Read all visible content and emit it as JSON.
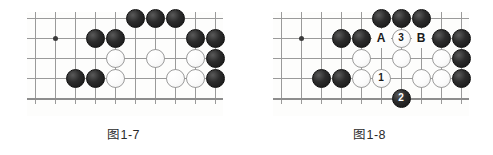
{
  "figures": [
    {
      "id": "fig-1-7",
      "caption": "图1-7",
      "board": {
        "cols": 10,
        "rows": 5,
        "spacing": 20,
        "hoshi": [
          {
            "col": 1,
            "row": 1
          }
        ],
        "bottom_edge": true
      },
      "stones": [
        {
          "col": 5,
          "row": 0,
          "color": "black"
        },
        {
          "col": 6,
          "row": 0,
          "color": "black"
        },
        {
          "col": 7,
          "row": 0,
          "color": "black"
        },
        {
          "col": 3,
          "row": 1,
          "color": "black"
        },
        {
          "col": 4,
          "row": 1,
          "color": "black"
        },
        {
          "col": 8,
          "row": 1,
          "color": "black"
        },
        {
          "col": 9,
          "row": 1,
          "color": "black"
        },
        {
          "col": 4,
          "row": 2,
          "color": "white"
        },
        {
          "col": 6,
          "row": 2,
          "color": "white"
        },
        {
          "col": 8,
          "row": 2,
          "color": "white"
        },
        {
          "col": 9,
          "row": 2,
          "color": "black"
        },
        {
          "col": 2,
          "row": 3,
          "color": "black"
        },
        {
          "col": 3,
          "row": 3,
          "color": "black"
        },
        {
          "col": 4,
          "row": 3,
          "color": "white"
        },
        {
          "col": 7,
          "row": 3,
          "color": "white"
        },
        {
          "col": 8,
          "row": 3,
          "color": "white"
        },
        {
          "col": 9,
          "row": 3,
          "color": "black"
        }
      ],
      "labels": []
    },
    {
      "id": "fig-1-8",
      "caption": "图1-8",
      "board": {
        "cols": 10,
        "rows": 5,
        "spacing": 20,
        "hoshi": [
          {
            "col": 1,
            "row": 1
          }
        ],
        "bottom_edge": true
      },
      "stones": [
        {
          "col": 5,
          "row": 0,
          "color": "black"
        },
        {
          "col": 6,
          "row": 0,
          "color": "black"
        },
        {
          "col": 7,
          "row": 0,
          "color": "black"
        },
        {
          "col": 3,
          "row": 1,
          "color": "black"
        },
        {
          "col": 4,
          "row": 1,
          "color": "black"
        },
        {
          "col": 6,
          "row": 1,
          "color": "white",
          "number": "3"
        },
        {
          "col": 8,
          "row": 1,
          "color": "black"
        },
        {
          "col": 9,
          "row": 1,
          "color": "black"
        },
        {
          "col": 4,
          "row": 2,
          "color": "white"
        },
        {
          "col": 6,
          "row": 2,
          "color": "white"
        },
        {
          "col": 8,
          "row": 2,
          "color": "white"
        },
        {
          "col": 9,
          "row": 2,
          "color": "black"
        },
        {
          "col": 2,
          "row": 3,
          "color": "black"
        },
        {
          "col": 3,
          "row": 3,
          "color": "black"
        },
        {
          "col": 4,
          "row": 3,
          "color": "white"
        },
        {
          "col": 5,
          "row": 3,
          "color": "white",
          "number": "1"
        },
        {
          "col": 7,
          "row": 3,
          "color": "white"
        },
        {
          "col": 8,
          "row": 3,
          "color": "white"
        },
        {
          "col": 9,
          "row": 3,
          "color": "black"
        },
        {
          "col": 6,
          "row": 4,
          "color": "black",
          "number": "2"
        }
      ],
      "labels": [
        {
          "col": 5,
          "row": 1,
          "text": "A"
        },
        {
          "col": 7,
          "row": 1,
          "text": "B"
        }
      ]
    }
  ]
}
